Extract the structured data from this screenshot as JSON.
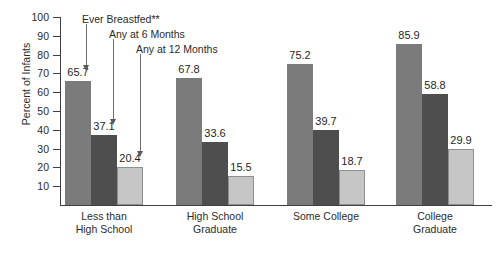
{
  "chart_data": {
    "type": "bar",
    "title": "",
    "xlabel": "",
    "ylabel": "Percent of Infants",
    "ylim": [
      0,
      100
    ],
    "ytick_step": 10,
    "grid": false,
    "legend_position": "inline-annotations",
    "categories": [
      [
        "Less than",
        "High School"
      ],
      [
        "High School",
        "Graduate"
      ],
      [
        "Some College",
        ""
      ],
      [
        "College",
        "Graduate"
      ]
    ],
    "category_labels_flat": [
      "Less than High School",
      "High School Graduate",
      "Some College",
      "College Graduate"
    ],
    "yticks": [
      10,
      20,
      30,
      40,
      50,
      60,
      70,
      80,
      90,
      100
    ],
    "series": [
      {
        "name": "Ever Breastfed**",
        "color": "#7b7b7b",
        "values": [
          65.7,
          67.8,
          75.2,
          85.9
        ],
        "value_labels": [
          "65.7",
          "67.8",
          "75.2",
          "85.9"
        ]
      },
      {
        "name": "Any at 6 Months",
        "color": "#4e4e4e",
        "values": [
          37.1,
          33.6,
          39.7,
          58.8
        ],
        "value_labels": [
          "37.1",
          "33.6",
          "39.7",
          "58.8"
        ]
      },
      {
        "name": "Any at 12 Months",
        "color": "#c6c6c6",
        "values": [
          20.4,
          15.5,
          18.7,
          29.9
        ],
        "value_labels": [
          "20.4",
          "15.5",
          "18.7",
          "29.9"
        ]
      }
    ],
    "annotations": [
      {
        "text": "Ever Breastfed**",
        "points_to_series": 0
      },
      {
        "text": "Any at 6 Months",
        "points_to_series": 1
      },
      {
        "text": "Any at 12 Months",
        "points_to_series": 2
      }
    ]
  }
}
